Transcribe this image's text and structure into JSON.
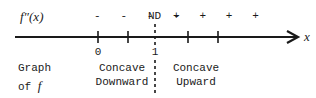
{
  "diagram": {
    "function_label": "f″(x)",
    "axis_variable": "x",
    "sign_row": {
      "left_signs": "-   -   -   -",
      "critical": "ND",
      "right_signs": "+   +   +   +"
    },
    "tick_labels": [
      {
        "label": "0"
      },
      {
        "label": "1"
      }
    ],
    "row_label": {
      "line1": "Graph",
      "line2_prefix": "of ",
      "line2_var": "f"
    },
    "intervals": [
      {
        "line1": "Concave",
        "line2": "Downward"
      },
      {
        "line1": "Concave",
        "line2": "Upward"
      }
    ],
    "colors": {
      "ink": "#1a1a1a",
      "background": "#ffffff"
    }
  }
}
